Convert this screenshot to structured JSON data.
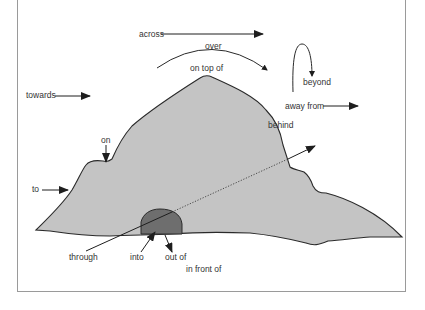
{
  "diagram": {
    "type": "prepositions-of-movement-illustration",
    "colors": {
      "hill_fill": "#c4c4c4",
      "cave_fill": "#6e6e6e",
      "stroke": "#2a2a2a",
      "frame": "#9a9a9a"
    },
    "labels": {
      "across": "across",
      "over": "over",
      "on_top_of": "on top of",
      "towards": "towards",
      "beyond": "beyond",
      "away_from": "away from",
      "behind": "behind",
      "on": "on",
      "to": "to",
      "through": "through",
      "into": "into",
      "out_of": "out of",
      "in_front_of": "in front of"
    }
  }
}
